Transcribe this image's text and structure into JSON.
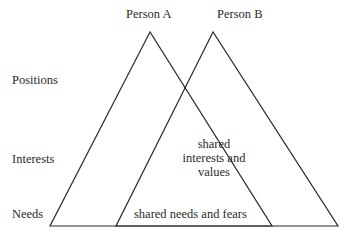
{
  "title": {
    "person_a": "Person A",
    "person_b": "Person B"
  },
  "levels": {
    "positions": "Positions",
    "interests": "Interests",
    "needs": "Needs"
  },
  "overlap": {
    "interests_line1": "shared",
    "interests_line2": "interests and",
    "interests_line3": "values",
    "needs": "shared needs and fears"
  },
  "colors": {
    "line": "#2a2a2a",
    "background": "#ffffff"
  }
}
